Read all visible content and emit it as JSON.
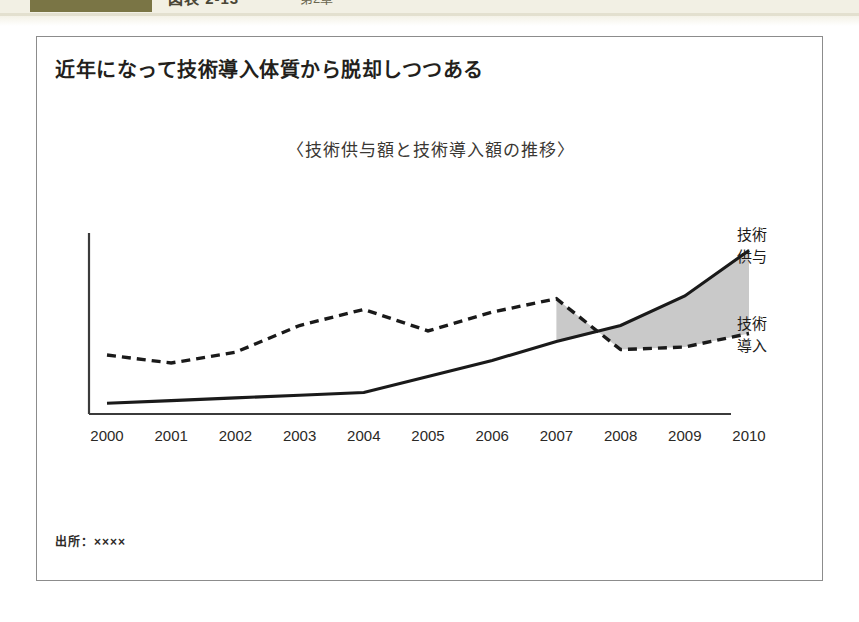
{
  "page_header": {
    "tab_swatch_color": "#7a7545",
    "clipped_title": "図表 2-13",
    "clipped_subtitle": "第2章"
  },
  "exhibit": {
    "title": "近年になって技術導入体質から脱却しつつある",
    "subtitle": "〈技術供与額と技術導入額の推移〉",
    "source_note": "出所：××××",
    "frame_border_color": "#8c8c8c"
  },
  "chart_data": {
    "type": "line",
    "title": "〈技術供与額と技術導入額の推移〉",
    "xlabel": "",
    "ylabel": "",
    "grid": false,
    "legend_position": "right-inline",
    "axis": {
      "x_axis_visible": true,
      "y_axis_visible": true,
      "y_tick_labels": [],
      "x_range": [
        "2000",
        "2010"
      ]
    },
    "categories": [
      "2000",
      "2001",
      "2002",
      "2003",
      "2004",
      "2005",
      "2006",
      "2007",
      "2008",
      "2009",
      "2010"
    ],
    "series": [
      {
        "name": "技術供与",
        "label_line1": "技術",
        "label_line2": "供与",
        "style": "solid",
        "color": "#1a1a1a",
        "values": [
          4,
          5,
          6,
          7,
          8,
          14,
          20,
          27,
          33,
          44,
          61
        ]
      },
      {
        "name": "技術導入",
        "label_line1": "技術",
        "label_line2": "導入",
        "style": "dashed",
        "color": "#1a1a1a",
        "values": [
          22,
          19,
          23,
          33,
          39,
          31,
          38,
          43,
          24,
          25,
          30
        ]
      }
    ],
    "shaded_band": {
      "label": "技術供与が技術導入を上回る領域",
      "fill_color": "#c9c9c9",
      "from_category": "2007",
      "to_category": "2010",
      "upper_series": "技術供与",
      "lower_series": "技術導入"
    }
  }
}
